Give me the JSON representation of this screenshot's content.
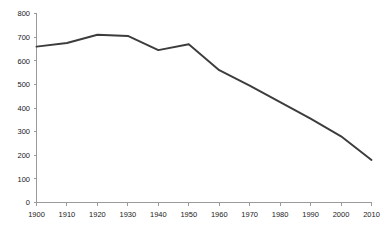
{
  "chart_data": {
    "type": "line",
    "title": "",
    "subtitle": "",
    "xlabel": "",
    "ylabel": "",
    "xlim": [
      1900,
      2010
    ],
    "ylim": [
      0,
      800
    ],
    "grid": false,
    "legend": false,
    "legend_position": "none",
    "x": [
      1900,
      1910,
      1920,
      1930,
      1940,
      1950,
      1960,
      1970,
      1980,
      1990,
      2000,
      2010
    ],
    "categories": [
      "1900",
      "1910",
      "1920",
      "1930",
      "1940",
      "1950",
      "1960",
      "1970",
      "1980",
      "1990",
      "2000",
      "2010"
    ],
    "series": [
      {
        "name": "series-1",
        "color": "#3c3c3c",
        "values": [
          660,
          675,
          710,
          705,
          645,
          670,
          560,
          495,
          425,
          355,
          280,
          180
        ]
      }
    ],
    "x_ticks": [
      "1900",
      "1910",
      "1920",
      "1930",
      "1940",
      "1950",
      "1960",
      "1970",
      "1980",
      "1990",
      "2000",
      "2010"
    ],
    "y_ticks": [
      "0",
      "100",
      "200",
      "300",
      "400",
      "500",
      "600",
      "700",
      "800"
    ],
    "y_tick_values": [
      0,
      100,
      200,
      300,
      400,
      500,
      600,
      700,
      800
    ],
    "axis_color": "#9a9a9a",
    "tick_label_color": "#1a1a1a",
    "background_color": "#ffffff"
  }
}
